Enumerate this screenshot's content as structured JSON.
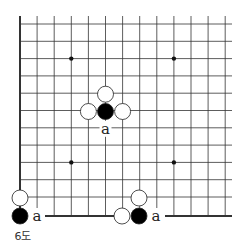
{
  "diagram": {
    "type": "go-board-diagram",
    "caption": "6도",
    "board": {
      "origin_x": 20,
      "origin_y": 24,
      "spacing_x": 17.1,
      "spacing_y": 17.3,
      "cols": 13,
      "rows": 12,
      "right_edge": 232,
      "star_points": [
        [
          3,
          2
        ],
        [
          9,
          2
        ],
        [
          3,
          8
        ],
        [
          9,
          8
        ]
      ]
    },
    "main_shape": {
      "stones": [
        {
          "color": "black",
          "col": 5,
          "row": 5
        },
        {
          "color": "white",
          "col": 5,
          "row": 4
        },
        {
          "color": "white",
          "col": 4,
          "row": 5
        },
        {
          "color": "white",
          "col": 6,
          "row": 5
        }
      ],
      "labels": [
        {
          "text": "a",
          "col": 5,
          "row": 6
        }
      ]
    },
    "inset_left": {
      "stones": [
        {
          "color": "white",
          "x": 20,
          "y": 198
        },
        {
          "color": "black",
          "x": 20,
          "y": 216
        }
      ],
      "label": {
        "text": "a",
        "x": 37,
        "y": 216
      }
    },
    "inset_right": {
      "stones": [
        {
          "color": "white",
          "x": 139,
          "y": 198
        },
        {
          "color": "white",
          "x": 122,
          "y": 216
        },
        {
          "color": "black",
          "x": 139,
          "y": 216
        }
      ],
      "label": {
        "text": "a",
        "x": 156,
        "y": 216
      }
    },
    "colors": {
      "black_stone": "#000000",
      "white_stone": "#ffffff",
      "line": "#333333"
    }
  }
}
